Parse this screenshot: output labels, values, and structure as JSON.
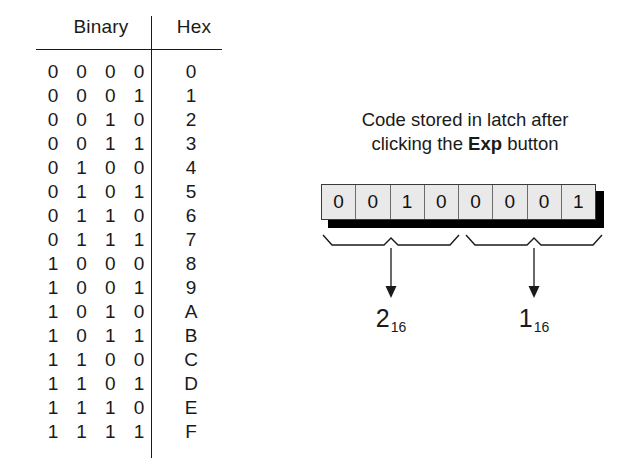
{
  "table": {
    "headers": {
      "binary": "Binary",
      "hex": "Hex"
    },
    "rows": [
      {
        "bits": [
          "0",
          "0",
          "0",
          "0"
        ],
        "hex": "0"
      },
      {
        "bits": [
          "0",
          "0",
          "0",
          "1"
        ],
        "hex": "1"
      },
      {
        "bits": [
          "0",
          "0",
          "1",
          "0"
        ],
        "hex": "2"
      },
      {
        "bits": [
          "0",
          "0",
          "1",
          "1"
        ],
        "hex": "3"
      },
      {
        "bits": [
          "0",
          "1",
          "0",
          "0"
        ],
        "hex": "4"
      },
      {
        "bits": [
          "0",
          "1",
          "0",
          "1"
        ],
        "hex": "5"
      },
      {
        "bits": [
          "0",
          "1",
          "1",
          "0"
        ],
        "hex": "6"
      },
      {
        "bits": [
          "0",
          "1",
          "1",
          "1"
        ],
        "hex": "7"
      },
      {
        "bits": [
          "1",
          "0",
          "0",
          "0"
        ],
        "hex": "8"
      },
      {
        "bits": [
          "1",
          "0",
          "0",
          "1"
        ],
        "hex": "9"
      },
      {
        "bits": [
          "1",
          "0",
          "1",
          "0"
        ],
        "hex": "A"
      },
      {
        "bits": [
          "1",
          "0",
          "1",
          "1"
        ],
        "hex": "B"
      },
      {
        "bits": [
          "1",
          "1",
          "0",
          "0"
        ],
        "hex": "C"
      },
      {
        "bits": [
          "1",
          "1",
          "0",
          "1"
        ],
        "hex": "D"
      },
      {
        "bits": [
          "1",
          "1",
          "1",
          "0"
        ],
        "hex": "E"
      },
      {
        "bits": [
          "1",
          "1",
          "1",
          "1"
        ],
        "hex": "F"
      }
    ]
  },
  "diagram": {
    "caption_line1": "Code stored in latch after",
    "caption_line2_before": "clicking the ",
    "caption_button": "Exp",
    "caption_line2_after": " button",
    "latch_bits": [
      "0",
      "0",
      "1",
      "0",
      "0",
      "0",
      "0",
      "1"
    ],
    "nibbles": [
      {
        "digit": "2",
        "base": "16"
      },
      {
        "digit": "1",
        "base": "16"
      }
    ]
  },
  "colors": {
    "ink": "#1a1a1a",
    "cell_fill": "#e9e9e9",
    "cell_border": "#6b6b6b",
    "shadow": "#000000",
    "background": "#ffffff"
  }
}
